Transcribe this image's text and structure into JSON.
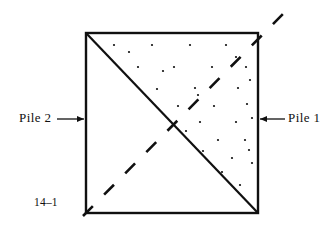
{
  "figure": {
    "number": "14–1",
    "left_label": "Pile 2",
    "right_label": "Pile 1",
    "colors": {
      "ink": "#101010",
      "background": "#ffffff"
    },
    "square": {
      "left": 86,
      "top": 33,
      "right": 258,
      "bottom": 213,
      "stroke_width": 2.4
    },
    "solid_diagonal": {
      "name": "solid-diagonal",
      "from": [
        86,
        33
      ],
      "to": [
        258,
        213
      ],
      "stroke_width": 2.2
    },
    "dashed_diagonal": {
      "name": "dashed-diagonal",
      "from": [
        83,
        216
      ],
      "to": [
        283,
        14
      ],
      "stroke_width": 2.6,
      "dash_pattern": "14 16"
    },
    "left_arrow": {
      "name": "pile-2-arrow",
      "from": [
        57,
        119
      ],
      "to": [
        84,
        119
      ],
      "direction": "right"
    },
    "right_arrow": {
      "name": "pile-1-arrow",
      "from": [
        285,
        119
      ],
      "to": [
        260,
        119
      ],
      "direction": "left"
    },
    "stipple": {
      "region": "upper-right-triangle",
      "dot_radius": 1.1,
      "dots": [
        [
          114,
          45
        ],
        [
          152,
          45
        ],
        [
          190,
          45
        ],
        [
          226,
          45
        ],
        [
          138,
          67
        ],
        [
          174,
          67
        ],
        [
          212,
          67
        ],
        [
          246,
          67
        ],
        [
          236,
          57
        ],
        [
          157,
          89
        ],
        [
          195,
          88
        ],
        [
          238,
          88
        ],
        [
          250,
          80
        ],
        [
          178,
          106
        ],
        [
          214,
          106
        ],
        [
          247,
          104
        ],
        [
          163,
          71
        ],
        [
          129,
          52
        ],
        [
          200,
          122
        ],
        [
          236,
          122
        ],
        [
          252,
          118
        ],
        [
          218,
          140
        ],
        [
          245,
          140
        ],
        [
          203,
          151
        ],
        [
          232,
          158
        ],
        [
          222,
          172
        ],
        [
          249,
          150
        ],
        [
          240,
          185
        ],
        [
          252,
          163
        ],
        [
          198,
          95
        ],
        [
          186,
          131
        ]
      ]
    }
  }
}
